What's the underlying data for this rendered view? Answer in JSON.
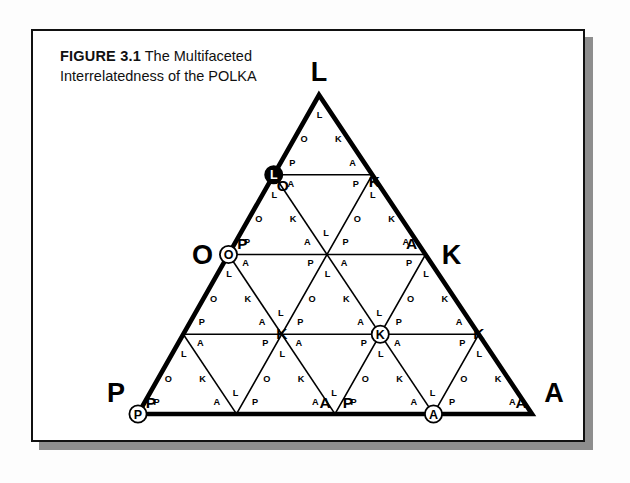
{
  "figure": {
    "label": "FIGURE 3.1",
    "title_line1": "The Multifaceted",
    "title_line2": "Interrelatedness of the POLKA"
  },
  "diagram": {
    "type": "subdivided-triangle",
    "subdivisions": 4,
    "corner_labels": {
      "apex": "L",
      "left_mid": "O",
      "right_mid": "K",
      "bottom_left": "P",
      "bottom_right": "A"
    },
    "cell_letters": {
      "apex": "L",
      "left_edge": "O",
      "right_edge": "K",
      "bottom_left": "P",
      "bottom_right": "A"
    },
    "circled_markers": [
      {
        "letter": "L",
        "style": "filled",
        "position": "upper-left-edge"
      },
      {
        "letter": "O",
        "style": "outline",
        "position": "left-edge-lower"
      },
      {
        "letter": "K",
        "style": "outline",
        "position": "center-right"
      },
      {
        "letter": "P",
        "style": "outline",
        "position": "bottom-left-corner"
      },
      {
        "letter": "A",
        "style": "outline",
        "position": "bottom-edge-right"
      }
    ],
    "solid_letters": [
      {
        "letter": "O",
        "position": "upper-left-inner"
      },
      {
        "letter": "K",
        "position": "upper-right-inner"
      },
      {
        "letter": "P",
        "position": "left-upper-inner"
      },
      {
        "letter": "A",
        "position": "right-upper-inner"
      },
      {
        "letter": "P",
        "position": "bottom-left-inner"
      },
      {
        "letter": "A",
        "position": "bottom-mid-inner"
      },
      {
        "letter": "P",
        "position": "bottom-mid-right-inner"
      },
      {
        "letter": "A",
        "position": "bottom-right-inner"
      },
      {
        "letter": "K",
        "position": "mid-left-row"
      },
      {
        "letter": "O",
        "position": "mid-center-row"
      },
      {
        "letter": "K",
        "position": "mid-right-row"
      }
    ],
    "colors": {
      "ink": "#000000",
      "card": "#ffffff",
      "shadow": "#8e8e8e",
      "page": "#fdfdfd"
    }
  }
}
